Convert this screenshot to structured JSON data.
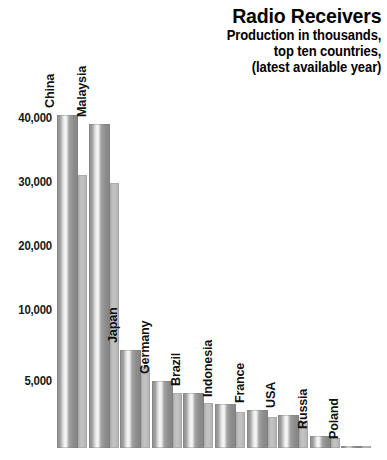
{
  "chart_data": {
    "type": "bar",
    "title": "Radio Receivers",
    "subtitle_lines": [
      "Production in thousands,",
      "top ten countries,",
      "(latest available year)"
    ],
    "xlabel": "",
    "ylabel": "",
    "ylim": [
      0,
      42000
    ],
    "grid": false,
    "legend": "none",
    "y_tick_labels": [
      "40,000",
      "30,000",
      "20,000",
      "10,000",
      "5,000"
    ],
    "y_tick_values": [
      40000,
      30000,
      20000,
      10000,
      5000
    ],
    "categories": [
      "China",
      "Malaysia",
      "Japan",
      "Germany",
      "Brazil",
      "Indonesia",
      "France",
      "USA",
      "Russia",
      "Poland"
    ],
    "values": [
      40500,
      39000,
      7200,
      5000,
      4100,
      3300,
      2800,
      2500,
      900,
      150
    ],
    "units": "thousands of units",
    "bar_style": "3d-shaded-gray",
    "colors": {
      "bar_face_light": "#f2f2f2",
      "bar_face_mid": "#9c9c9c",
      "bar_face_dark": "#848484",
      "bar_side": "#bdbdbd",
      "text": "#000000",
      "background": "#ffffff"
    }
  }
}
